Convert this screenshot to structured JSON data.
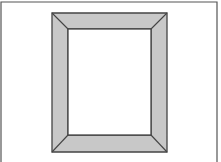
{
  "diagram": {
    "colors": {
      "background": "#ffffff",
      "border": "#555555",
      "frame_fill": "#c8c8c8",
      "frame_stroke": "#444444",
      "opening_fill": "#ffffff"
    },
    "canvas_border": {
      "left": 1,
      "top": 2,
      "right": 217,
      "bottom": 162
    },
    "frame_outer": {
      "x1": 52,
      "y1": 13,
      "x2": 167,
      "y2": 152
    },
    "frame_inner": {
      "x1": 68,
      "y1": 29,
      "x2": 151,
      "y2": 135
    }
  }
}
